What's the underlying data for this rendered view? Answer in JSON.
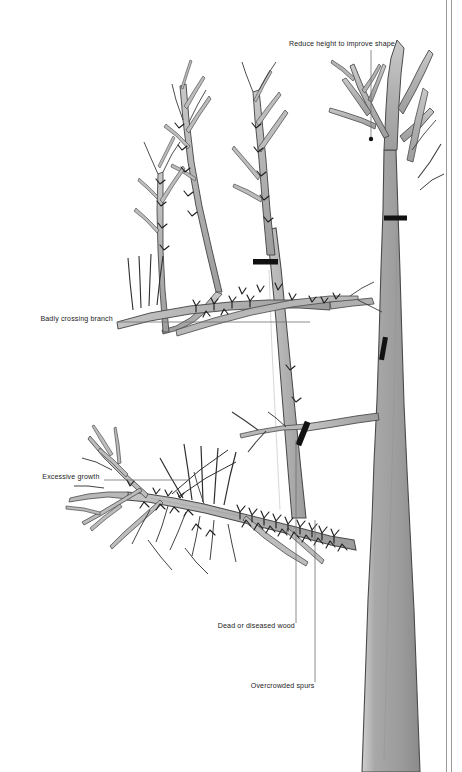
{
  "figure": {
    "type": "botanical-pruning-illustration",
    "background_color": "#ffffff",
    "ink_color": "#333333",
    "branch_fill": "#b3b3b3",
    "trunk_fill": "#9a9a9a",
    "cut_mark_color": "#111111",
    "leader_line_color": "#6e6e6e",
    "text_color": "#1b1b1b",
    "border_line_color": "#9b9b9b"
  },
  "labels": {
    "reduce_height": "Reduce height to improve shape",
    "badly_crossing": "Badly crossing branch",
    "excessive_growth": "Excessive growth",
    "dead_wood": "Dead or diseased wood",
    "overcrowded_spurs": "Overcrowded spurs"
  },
  "annotations": [
    {
      "id": "reduce-height",
      "label": "Reduce height to improve shape",
      "align": "right",
      "text_x": 395,
      "text_y": 44,
      "leader": {
        "x1": 371,
        "y1": 50,
        "x2": 371,
        "y2": 138
      },
      "marker": {
        "x": 371,
        "y": 139,
        "r": 2.2
      }
    },
    {
      "id": "badly-crossing-branch",
      "label": "Badly crossing branch",
      "align": "right",
      "text_x": 113,
      "text_y": 319,
      "leader": {
        "x1": 118,
        "y1": 322,
        "x2": 310,
        "y2": 322
      }
    },
    {
      "id": "excessive-growth",
      "label": "Excessive growth",
      "align": "right",
      "text_x": 99,
      "text_y": 477,
      "leader": {
        "x1": 104,
        "y1": 480,
        "x2": 188,
        "y2": 480
      }
    },
    {
      "id": "dead-or-diseased-wood",
      "label": "Dead or diseased wood",
      "align": "right",
      "text_x": 295,
      "text_y": 627,
      "leader": {
        "x1": 296,
        "y1": 624,
        "x2": 296,
        "y2": 440
      }
    },
    {
      "id": "overcrowded-spurs",
      "label": "Overcrowded spurs",
      "align": "right",
      "text_x": 314,
      "text_y": 687,
      "leader": {
        "x1": 315,
        "y1": 684,
        "x2": 315,
        "y2": 520
      }
    }
  ],
  "cut_marks": [
    {
      "id": "cut-top-right-trunk",
      "x": 395,
      "y": 218,
      "w": 22,
      "h": 5,
      "rotate": 0
    },
    {
      "id": "cut-central-leader",
      "x": 265,
      "y": 262,
      "w": 24,
      "h": 5,
      "rotate": 0
    },
    {
      "id": "cut-right-branch",
      "x": 384,
      "y": 348,
      "w": 5,
      "h": 22,
      "rotate": 12
    },
    {
      "id": "cut-mid-branch",
      "x": 303,
      "y": 433,
      "w": 6,
      "h": 24,
      "rotate": 25
    }
  ],
  "border": {
    "right_rule_1_x": 446,
    "right_rule_2_x": 451,
    "width": 1
  },
  "canvas": {
    "width": 462,
    "height": 772
  }
}
